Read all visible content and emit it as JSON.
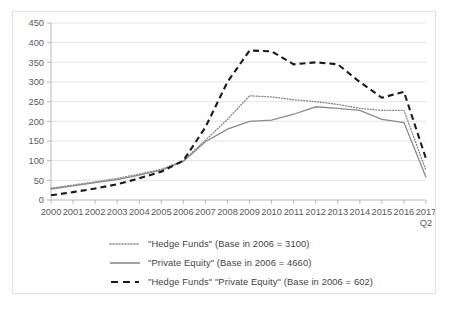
{
  "chart_data": {
    "type": "line",
    "title": "",
    "xlabel": "",
    "ylabel": "",
    "ylim": [
      0,
      450
    ],
    "ytick_step": 50,
    "grid": true,
    "legend_position": "bottom",
    "x": [
      "2000",
      "2001",
      "2002",
      "2003",
      "2004",
      "2005",
      "2006",
      "2007",
      "2008",
      "2009",
      "2010",
      "2011",
      "2012",
      "2013",
      "2014",
      "2015",
      "2016",
      "2017 Q2"
    ],
    "ytick_labels": [
      "450",
      "400",
      "350",
      "300",
      "250",
      "200",
      "150",
      "100",
      "50",
      "0"
    ],
    "xtick_labels": [
      "2000",
      "2001",
      "2002",
      "2003",
      "2004",
      "2005",
      "2006",
      "2007",
      "2008",
      "2009",
      "2010",
      "2011",
      "2012",
      "2013",
      "2014",
      "2015",
      "2016",
      "2017"
    ],
    "last_tick_second_line": "Q2",
    "series": [
      {
        "name": "\"Hedge Funds\" (Base in 2006 = 3100)",
        "style": "dotted",
        "color": "#808080",
        "values": [
          30,
          38,
          46,
          55,
          66,
          78,
          100,
          152,
          205,
          265,
          262,
          255,
          250,
          243,
          233,
          228,
          228,
          75
        ]
      },
      {
        "name": "\"Private Equity\" (Base in 2006 = 4660)",
        "style": "solid",
        "color": "#8a8a8a",
        "values": [
          28,
          36,
          44,
          52,
          63,
          76,
          98,
          148,
          180,
          200,
          203,
          218,
          237,
          233,
          228,
          205,
          197,
          58
        ]
      },
      {
        "name": "\"Hedge Funds\" \"Private Equity\" (Base in 2006 = 602)",
        "style": "dashed",
        "color": "#1a1a1a",
        "values": [
          12,
          20,
          29,
          40,
          55,
          72,
          100,
          185,
          300,
          380,
          378,
          345,
          350,
          345,
          300,
          260,
          275,
          105
        ]
      }
    ]
  },
  "legend": {
    "items": [
      {
        "label": "\"Hedge Funds\" (Base in 2006 = 3100)",
        "style": "dotted"
      },
      {
        "label": "\"Private Equity\" (Base in 2006 = 4660)",
        "style": "solid"
      },
      {
        "label": "\"Hedge Funds\" \"Private Equity\" (Base in 2006 = 602)",
        "style": "dashed"
      }
    ]
  },
  "caption": {
    "text": ""
  }
}
